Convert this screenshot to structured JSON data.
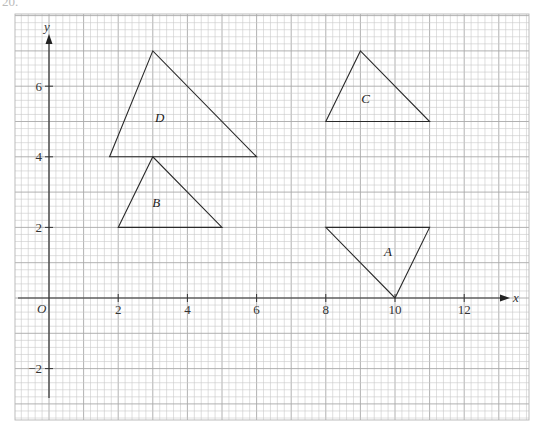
{
  "question_number": "20.",
  "diagram": {
    "type": "coordinate-grid",
    "axes": {
      "x_label": "x",
      "y_label": "y",
      "origin_label": "O",
      "x_ticks": [
        {
          "value": 2,
          "label": "2"
        },
        {
          "value": 4,
          "label": "4"
        },
        {
          "value": 6,
          "label": "6"
        },
        {
          "value": 8,
          "label": "8"
        },
        {
          "value": 10,
          "label": "10"
        },
        {
          "value": 12,
          "label": "12"
        }
      ],
      "y_ticks": [
        {
          "value": 6,
          "label": "6"
        },
        {
          "value": 4,
          "label": "4"
        },
        {
          "value": 2,
          "label": "2"
        },
        {
          "value": -2,
          "label": "−2"
        }
      ],
      "x_range": [
        -1,
        13.8
      ],
      "y_range": [
        -3.5,
        8
      ]
    },
    "grid": {
      "minor_per_unit": 5,
      "on": true
    },
    "shapes": [
      {
        "label": "A",
        "vertices": [
          [
            8,
            2
          ],
          [
            11,
            2
          ],
          [
            10,
            0
          ]
        ],
        "label_pos": [
          9.8,
          1.3
        ]
      },
      {
        "label": "B",
        "vertices": [
          [
            2,
            2
          ],
          [
            3,
            4
          ],
          [
            5,
            2
          ]
        ],
        "label_pos": [
          3.1,
          2.7
        ]
      },
      {
        "label": "C",
        "vertices": [
          [
            8,
            5
          ],
          [
            9,
            7
          ],
          [
            11,
            5
          ]
        ],
        "label_pos": [
          9.15,
          5.65
        ]
      },
      {
        "label": "D",
        "vertices": [
          [
            1.75,
            4
          ],
          [
            3,
            7
          ],
          [
            6,
            4
          ]
        ],
        "label_pos": [
          3.2,
          5.1
        ]
      }
    ]
  }
}
